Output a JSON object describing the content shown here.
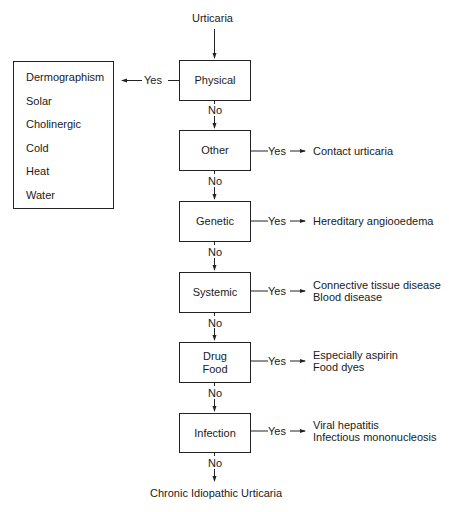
{
  "diagram": {
    "start": "Urticaria",
    "end": "Chronic Idiopathic Urticaria",
    "yes_label": "Yes",
    "no_label": "No",
    "nodes": [
      {
        "id": "physical",
        "label": [
          "Physical"
        ],
        "outcomes": [
          "Dermographism",
          "Solar",
          "Cholinergic",
          "Cold",
          "Heat",
          "Water"
        ],
        "yes_direction": "left"
      },
      {
        "id": "other",
        "label": [
          "Other"
        ],
        "outcomes": [
          "Contact urticaria"
        ],
        "yes_direction": "right"
      },
      {
        "id": "genetic",
        "label": [
          "Genetic"
        ],
        "outcomes": [
          "Hereditary angiooedema"
        ],
        "yes_direction": "right"
      },
      {
        "id": "systemic",
        "label": [
          "Systemic"
        ],
        "outcomes": [
          "Connective tissue disease",
          "Blood disease"
        ],
        "yes_direction": "right"
      },
      {
        "id": "drug-food",
        "label": [
          "Drug",
          "Food"
        ],
        "outcomes": [
          "Especially aspirin",
          "Food dyes"
        ],
        "yes_direction": "right"
      },
      {
        "id": "infection",
        "label": [
          "Infection"
        ],
        "outcomes": [
          "Viral hepatitis",
          "Infectious mononucleosis"
        ],
        "yes_direction": "right"
      }
    ]
  }
}
